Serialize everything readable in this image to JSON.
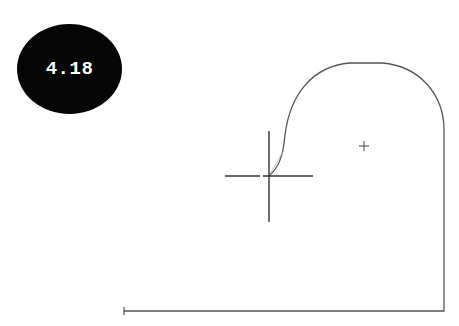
{
  "figure": {
    "label": "4.18",
    "badge_color": "#050505",
    "badge_text_color": "#ffffff"
  },
  "drawing": {
    "line_color": "#555555",
    "crosshair_color": "#333333",
    "rubberband_color": "#aaaaaa",
    "crosshair": {
      "x": 269,
      "y": 176,
      "half_width": 44,
      "half_height": 45
    },
    "arc_center_marker": {
      "x": 364,
      "y": 146,
      "size": 5
    },
    "start_point_marker": {
      "x": 124,
      "y": 311
    },
    "profile": {
      "bottom_left": [
        124,
        311
      ],
      "bottom_right": [
        444,
        311
      ],
      "right_top": [
        444,
        130
      ],
      "arc_top_y": 63
    }
  }
}
